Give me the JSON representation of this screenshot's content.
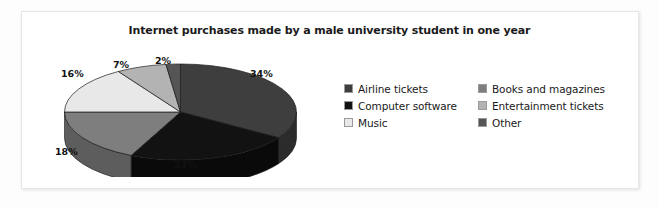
{
  "figure": {
    "background_color": "#fdfdfd",
    "panel_color": "#ffffff",
    "border_color": "#e6e6e6"
  },
  "chart_data": {
    "type": "pie",
    "title": "Internet purchases made by a male university student in one year",
    "xlabel": "",
    "ylabel": "",
    "unit": "%",
    "start_angle_deg": 0,
    "direction": "clockwise",
    "three_d": true,
    "legend_position": "right",
    "grid": false,
    "categories": [
      "Airline tickets",
      "Computer software",
      "Books and magazines",
      "Music",
      "Entertainment tickets",
      "Other"
    ],
    "values": [
      34,
      23,
      18,
      16,
      7,
      2
    ],
    "data_labels": [
      "34%",
      "23%",
      "18%",
      "16%",
      "7%",
      "2%"
    ],
    "colors": [
      "#3e3e3e",
      "#121212",
      "#7e7e7e",
      "#e8e8e8",
      "#b3b3b3",
      "#555555"
    ],
    "slices": [
      {
        "label": "Airline tickets",
        "value": 34,
        "data_label": "34%",
        "color": "#3e3e3e",
        "side_color": "#2b2b2b"
      },
      {
        "label": "Computer software",
        "value": 23,
        "data_label": "23%",
        "color": "#121212",
        "side_color": "#0a0a0a"
      },
      {
        "label": "Books and magazines",
        "value": 18,
        "data_label": "18%",
        "color": "#7e7e7e",
        "side_color": "#5d5d5d"
      },
      {
        "label": "Music",
        "value": 16,
        "data_label": "16%",
        "color": "#e8e8e8",
        "side_color": "#bfbfbf"
      },
      {
        "label": "Entertainment tickets",
        "value": 7,
        "data_label": "7%",
        "color": "#b3b3b3",
        "side_color": "#8e8e8e"
      },
      {
        "label": "Other",
        "value": 2,
        "data_label": "2%",
        "color": "#555555",
        "side_color": "#3c3c3c"
      }
    ]
  },
  "legend": {
    "items": [
      {
        "label": "Airline tickets",
        "color": "#3e3e3e"
      },
      {
        "label": "Books and magazines",
        "color": "#7e7e7e"
      },
      {
        "label": "Computer software",
        "color": "#121212"
      },
      {
        "label": "Entertainment tickets",
        "color": "#b3b3b3"
      },
      {
        "label": "Music",
        "color": "#e8e8e8"
      },
      {
        "label": "Other",
        "color": "#555555"
      }
    ]
  }
}
